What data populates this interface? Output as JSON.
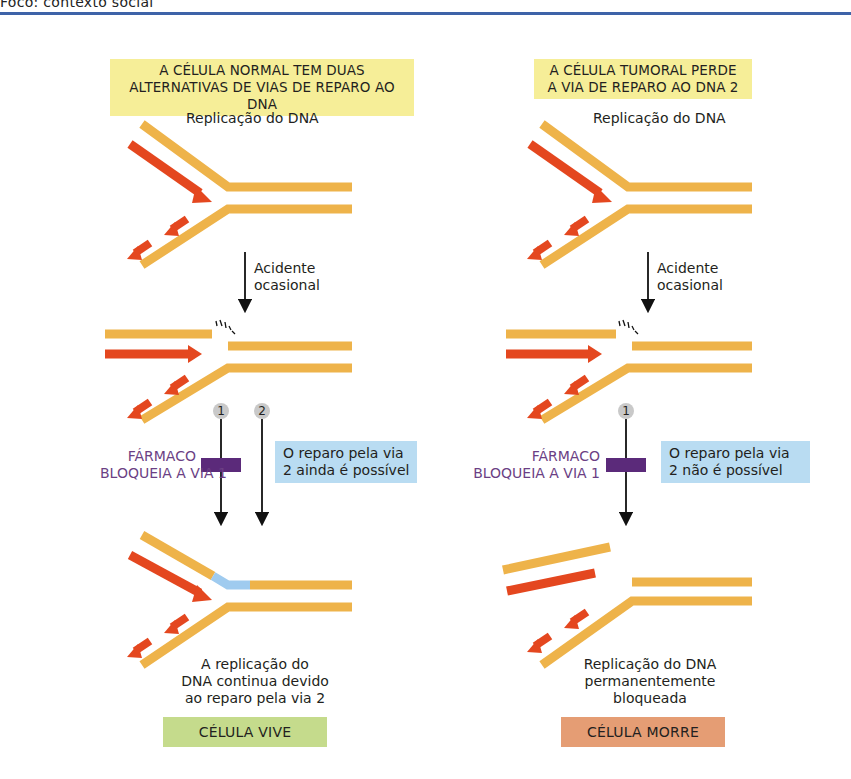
{
  "page": {
    "running_header": "Foco: contexto social",
    "rule_color": "#3e63a8"
  },
  "colors": {
    "template_strand": "#eeb34a",
    "new_strand": "#e4471f",
    "repair_patch": "#9fcbef",
    "drug_block": "#5b2a7a",
    "header_bg": "#f6ee98",
    "info_bg": "#b9dcf2",
    "lives_bg": "#c5db8c",
    "dies_bg": "#e59d74",
    "step_circle": "#c9c9c9"
  },
  "left_panel": {
    "header_line1": "A CÉLULA NORMAL TEM DUAS",
    "header_line2": "ALTERNATIVAS DE VIAS DE REPARO AO DNA",
    "replication_label": "Replicação do DNA",
    "accident_line1": "Acidente",
    "accident_line2": "ocasional",
    "pathway_1": "1",
    "pathway_2": "2",
    "drug_line1": "FÁRMACO",
    "drug_line2": "BLOQUEIA A VIA 1",
    "info_line1": "O reparo pela via",
    "info_line2": "2 ainda é possível",
    "outcome_line1": "A replicação do",
    "outcome_line2": "DNA continua devido",
    "outcome_line3": "ao reparo pela via 2",
    "result": "CÉLULA VIVE"
  },
  "right_panel": {
    "header_line1": "A CÉLULA TUMORAL PERDE",
    "header_line2": "A VIA DE REPARO AO DNA 2",
    "replication_label": "Replicação do DNA",
    "accident_line1": "Acidente",
    "accident_line2": "ocasional",
    "pathway_1": "1",
    "drug_line1": "FÁRMACO",
    "drug_line2": "BLOQUEIA A VIA 1",
    "info_line1": "O reparo pela via",
    "info_line2": "2 não é possível",
    "outcome_line1": "Replicação do DNA",
    "outcome_line2": "permanentemente",
    "outcome_line3": "bloqueada",
    "result": "CÉLULA MORRE"
  }
}
